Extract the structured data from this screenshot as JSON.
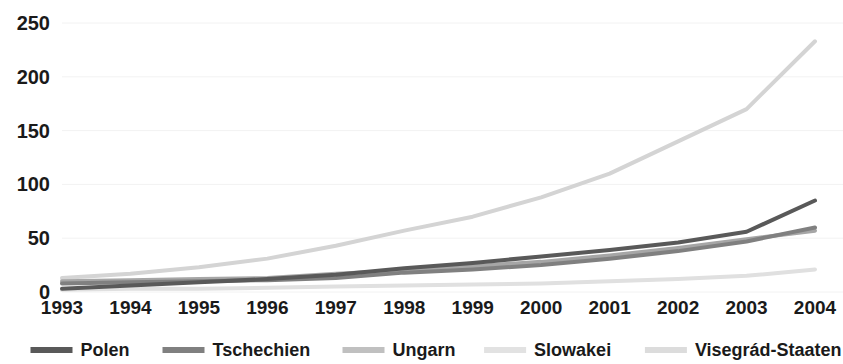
{
  "chart_data": {
    "type": "line",
    "title": "",
    "subtitle": "",
    "xlabel": "",
    "ylabel": "",
    "categories": [
      "1993",
      "1994",
      "1995",
      "1996",
      "1997",
      "1998",
      "1999",
      "2000",
      "2001",
      "2002",
      "2003",
      "2004"
    ],
    "x_tick_labels": [
      "1993",
      "1994",
      "1995",
      "1996",
      "1997",
      "1998",
      "1999",
      "2000",
      "2001",
      "2002",
      "2003",
      "2004"
    ],
    "y_tick_labels": [
      "0",
      "50",
      "100",
      "150",
      "200",
      "250"
    ],
    "y_ticks": [
      0,
      50,
      100,
      150,
      200,
      250
    ],
    "ylim": [
      0,
      250
    ],
    "grid": true,
    "grid_axis": "y",
    "legend_position": "bottom",
    "series": [
      {
        "name": "Polen",
        "color": "#595959",
        "width": 4,
        "values": [
          3,
          6,
          9,
          12,
          16,
          22,
          27,
          33,
          39,
          46,
          56,
          85
        ]
      },
      {
        "name": "Tschechien",
        "color": "#808080",
        "width": 4,
        "values": [
          8,
          9,
          10,
          11,
          13,
          18,
          21,
          25,
          31,
          38,
          47,
          60
        ]
      },
      {
        "name": "Ungarn",
        "color": "#a6a6a6",
        "width": 4,
        "values": [
          10,
          11,
          12,
          13,
          17,
          20,
          24,
          28,
          34,
          41,
          49,
          57
        ]
      },
      {
        "name": "Slowakei",
        "color": "#e0e0e0",
        "width": 4,
        "values": [
          2,
          3,
          3,
          4,
          5,
          6,
          7,
          8,
          10,
          12,
          15,
          21
        ]
      },
      {
        "name": "Visegrád-Staaten",
        "color": "#d4d4d4",
        "width": 4,
        "values": [
          13,
          17,
          23,
          31,
          43,
          57,
          70,
          88,
          110,
          140,
          170,
          233
        ]
      }
    ]
  },
  "legend": {
    "items": [
      {
        "label": "Polen",
        "color": "#595959"
      },
      {
        "label": "Tschechien",
        "color": "#808080"
      },
      {
        "label": "Ungarn",
        "color": "#c0c0c0"
      },
      {
        "label": "Slowakei",
        "color": "#e2e2e2"
      },
      {
        "label": "Visegrád-Staaten",
        "color": "#dcdcdc"
      }
    ]
  }
}
